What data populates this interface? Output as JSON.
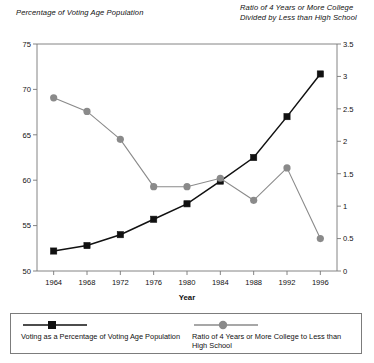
{
  "chart_data": {
    "type": "line",
    "title": "",
    "xlabel": "Year",
    "left_axis_title": "Percentage of Voting Age Population",
    "right_axis_title": "Ratio of 4 Years or More College Divided by Less than High School",
    "categories": [
      1964,
      1968,
      1972,
      1976,
      1980,
      1984,
      1988,
      1992,
      1996
    ],
    "xtick_labels": [
      "1964",
      "1968",
      "1972",
      "1976",
      "1980",
      "1984",
      "1988",
      "1992",
      "1996"
    ],
    "xlim": [
      1962,
      1998
    ],
    "left_ylim": [
      50,
      75
    ],
    "right_ylim": [
      0,
      3.5
    ],
    "left_ytick_labels": [
      "50",
      "55",
      "60",
      "65",
      "70",
      "75"
    ],
    "left_yticks": [
      50,
      55,
      60,
      65,
      70,
      75
    ],
    "right_ytick_labels": [
      "0",
      "0.5",
      "1",
      "1.5",
      "2",
      "2.5",
      "3",
      "3.5"
    ],
    "right_yticks": [
      0,
      0.5,
      1,
      1.5,
      2,
      2.5,
      3,
      3.5
    ],
    "grid": false,
    "legend_position": "bottom",
    "series": [
      {
        "name": "Voting as a Percentage of Voting Age Population",
        "axis": "left",
        "color": "#111111",
        "marker": "square",
        "values": [
          52.2,
          52.8,
          54.0,
          55.7,
          57.4,
          59.9,
          62.5,
          67.0,
          71.7
        ]
      },
      {
        "name": "Ratio of 4 Years or More College to Less than High School",
        "axis": "right",
        "color": "#8a8a8a",
        "marker": "circle",
        "values": [
          2.67,
          2.46,
          2.03,
          1.3,
          1.3,
          1.43,
          1.09,
          1.59,
          0.5
        ]
      }
    ]
  },
  "legend": {
    "entries": [
      {
        "label": "Voting as a Percentage of Voting Age Population"
      },
      {
        "label": "Ratio of 4 Years or More College to Less than High School"
      }
    ]
  }
}
